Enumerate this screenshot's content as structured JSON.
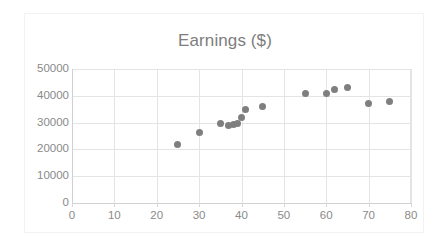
{
  "chart_data": {
    "type": "scatter",
    "title": "Earnings ($)",
    "xlabel": "",
    "ylabel": "",
    "xlim": [
      0,
      80
    ],
    "ylim": [
      0,
      50000
    ],
    "xticks": [
      0,
      10,
      20,
      30,
      40,
      50,
      60,
      70,
      80
    ],
    "yticks": [
      0,
      10000,
      20000,
      30000,
      40000,
      50000
    ],
    "xtick_labels": [
      "0",
      "10",
      "20",
      "30",
      "40",
      "50",
      "60",
      "70",
      "80"
    ],
    "ytick_labels": [
      "0",
      "10000",
      "20000",
      "30000",
      "40000",
      "50000"
    ],
    "grid": true,
    "legend": false,
    "marker_color": "#7f7f7f",
    "series": [
      {
        "name": "Earnings",
        "points": [
          {
            "x": 25,
            "y": 22000
          },
          {
            "x": 30,
            "y": 26200
          },
          {
            "x": 35,
            "y": 29500
          },
          {
            "x": 37,
            "y": 28800
          },
          {
            "x": 38,
            "y": 29200
          },
          {
            "x": 39,
            "y": 29500
          },
          {
            "x": 40,
            "y": 32000
          },
          {
            "x": 41,
            "y": 35000
          },
          {
            "x": 45,
            "y": 36000
          },
          {
            "x": 55,
            "y": 41000
          },
          {
            "x": 60,
            "y": 41000
          },
          {
            "x": 62,
            "y": 42500
          },
          {
            "x": 65,
            "y": 43000
          },
          {
            "x": 70,
            "y": 37000
          },
          {
            "x": 75,
            "y": 37700
          }
        ]
      }
    ]
  },
  "chart": {
    "title": "Earnings ($)",
    "plot_background": "#ffffff",
    "gridline_color": "#e4e4e4",
    "axis_label_color": "#8a8a8a",
    "title_color": "#7d7d7d",
    "border_color": "#f2f2f2"
  }
}
